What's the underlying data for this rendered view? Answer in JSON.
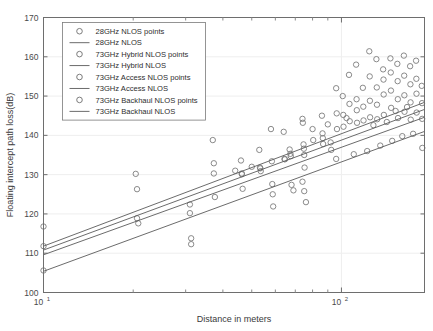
{
  "chart_data": {
    "type": "scatter",
    "title": "",
    "xlabel": "Distance in meters",
    "ylabel": "Floating intercept path loss(dB)",
    "xscale": "log",
    "yscale": "linear",
    "xlim": [
      10,
      190
    ],
    "ylim": [
      100,
      170
    ],
    "yticks": [
      100,
      110,
      120,
      130,
      140,
      150,
      160,
      170
    ],
    "ytick_labels": [
      "100",
      "110",
      "120",
      "130",
      "140",
      "150",
      "160",
      "170"
    ],
    "xtick_majors": [
      {
        "value": 10,
        "mantissa": "10",
        "exponent": "1"
      },
      {
        "value": 100,
        "mantissa": "10",
        "exponent": "2"
      }
    ],
    "xtick_minors": [
      20,
      30,
      40,
      50,
      60,
      70,
      80,
      90,
      200,
      300,
      400,
      500,
      600,
      700,
      800,
      900
    ],
    "grid": true,
    "grid_axis": "y",
    "legend_position": "upper left",
    "marker": "open-circle",
    "marker_color": "#7d7d7d",
    "line_color": "#5a5a5a",
    "legend": [
      {
        "label": "28GHz NLOS points",
        "kind": "marker"
      },
      {
        "label": "28GHz NLOS",
        "kind": "line"
      },
      {
        "label": "73GHz Hybrid NLOS points",
        "kind": "marker"
      },
      {
        "label": "73GHz Hybrid NLOS",
        "kind": "line"
      },
      {
        "label": "73GHz Access NLOS points",
        "kind": "marker"
      },
      {
        "label": "73GHz Access NLOS",
        "kind": "line"
      },
      {
        "label": "73GHz Backhaul NLOS points",
        "kind": "marker"
      },
      {
        "label": "73GHz Backhaul NLOS",
        "kind": "line"
      }
    ],
    "fit_lines": [
      {
        "name": "28GHz NLOS",
        "x_start": 10,
        "y_start": 111.8,
        "x_end": 190,
        "y_end": 148.4
      },
      {
        "name": "73GHz Hybrid NLOS",
        "x_start": 10,
        "y_start": 110.8,
        "x_end": 190,
        "y_end": 146.6
      },
      {
        "name": "73GHz Access NLOS",
        "x_start": 10,
        "y_start": 109.6,
        "x_end": 190,
        "y_end": 144.6
      },
      {
        "name": "73GHz Backhaul NLOS",
        "x_start": 10,
        "y_start": 105.4,
        "x_end": 190,
        "y_end": 141.0
      }
    ],
    "points": [
      [
        10.0,
        116.8
      ],
      [
        10.0,
        111.8
      ],
      [
        10.0,
        105.6
      ],
      [
        20.4,
        130.2
      ],
      [
        20.6,
        126.3
      ],
      [
        20.6,
        118.9
      ],
      [
        20.8,
        117.6
      ],
      [
        31.0,
        122.4
      ],
      [
        31.0,
        120.2
      ],
      [
        31.3,
        113.8
      ],
      [
        31.3,
        112.3
      ],
      [
        37.0,
        138.8
      ],
      [
        37.3,
        132.9
      ],
      [
        37.3,
        130.3
      ],
      [
        37.6,
        124.3
      ],
      [
        46.0,
        133.6
      ],
      [
        46.3,
        130.3
      ],
      [
        46.3,
        130.1
      ],
      [
        46.6,
        126.4
      ],
      [
        53.0,
        136.3
      ],
      [
        53.3,
        131.8
      ],
      [
        53.4,
        131.6
      ],
      [
        53.6,
        130.9
      ],
      [
        58.0,
        141.6
      ],
      [
        58.4,
        133.4
      ],
      [
        58.6,
        127.6
      ],
      [
        58.8,
        125.0
      ],
      [
        59.0,
        121.9
      ],
      [
        64.0,
        140.9
      ],
      [
        64.4,
        134.0
      ],
      [
        64.6,
        133.9
      ],
      [
        67.0,
        136.4
      ],
      [
        67.4,
        135.3
      ],
      [
        67.6,
        134.7
      ],
      [
        74.0,
        144.2
      ],
      [
        74.2,
        143.2
      ],
      [
        74.6,
        137.7
      ],
      [
        74.8,
        136.6
      ],
      [
        75.0,
        135.0
      ],
      [
        75.2,
        131.8
      ],
      [
        80.0,
        141.6
      ],
      [
        80.4,
        138.8
      ],
      [
        86.0,
        145.0
      ],
      [
        86.4,
        140.5
      ],
      [
        86.6,
        139.3
      ],
      [
        86.8,
        137.8
      ],
      [
        92.0,
        138.2
      ],
      [
        92.4,
        136.3
      ],
      [
        96.0,
        152.0
      ],
      [
        96.4,
        145.6
      ],
      [
        96.6,
        141.6
      ],
      [
        101.0,
        150.0
      ],
      [
        101.4,
        145.2
      ],
      [
        101.6,
        142.2
      ],
      [
        106.0,
        155.4
      ],
      [
        106.4,
        148.0
      ],
      [
        106.6,
        143.6
      ],
      [
        112.0,
        158.0
      ],
      [
        112.4,
        149.2
      ],
      [
        112.6,
        146.4
      ],
      [
        112.8,
        143.2
      ],
      [
        118.0,
        152.1
      ],
      [
        118.4,
        147.3
      ],
      [
        118.6,
        143.8
      ],
      [
        124.0,
        161.4
      ],
      [
        124.4,
        155.0
      ],
      [
        124.6,
        148.8
      ],
      [
        124.8,
        144.6
      ],
      [
        131.0,
        159.4
      ],
      [
        131.4,
        152.2
      ],
      [
        131.6,
        147.8
      ],
      [
        131.8,
        144.1
      ],
      [
        138.0,
        156.8
      ],
      [
        138.4,
        154.2
      ],
      [
        138.6,
        150.4
      ],
      [
        138.8,
        145.2
      ],
      [
        146.0,
        159.6
      ],
      [
        146.4,
        156.0
      ],
      [
        146.6,
        151.4
      ],
      [
        146.8,
        147.0
      ],
      [
        154.0,
        158.2
      ],
      [
        154.4,
        153.8
      ],
      [
        154.6,
        149.2
      ],
      [
        154.8,
        144.4
      ],
      [
        162.0,
        160.3
      ],
      [
        162.4,
        155.2
      ],
      [
        162.6,
        150.2
      ],
      [
        162.8,
        146.0
      ],
      [
        170.0,
        157.6
      ],
      [
        170.4,
        153.0
      ],
      [
        170.6,
        148.4
      ],
      [
        170.8,
        144.0
      ],
      [
        178.0,
        159.0
      ],
      [
        178.4,
        154.4
      ],
      [
        178.6,
        150.6
      ],
      [
        178.8,
        145.8
      ],
      [
        186.0,
        152.6
      ],
      [
        186.4,
        148.2
      ],
      [
        186.6,
        144.2
      ],
      [
        186.8,
        136.8
      ],
      [
        74.0,
        128.2
      ],
      [
        75.0,
        125.8
      ],
      [
        76.0,
        123.0
      ],
      [
        68.0,
        127.4
      ],
      [
        69.0,
        126.0
      ],
      [
        96.0,
        134.0
      ],
      [
        110.0,
        135.2
      ],
      [
        122.0,
        136.0
      ],
      [
        135.0,
        137.4
      ],
      [
        148.0,
        138.6
      ],
      [
        160.0,
        139.8
      ],
      [
        174.0,
        140.4
      ],
      [
        44.0,
        131.0
      ],
      [
        50.0,
        132.0
      ],
      [
        128.0,
        142.6
      ],
      [
        142.0,
        143.4
      ],
      [
        152.0,
        146.2
      ],
      [
        166.0,
        147.2
      ],
      [
        90.0,
        142.8
      ],
      [
        104.0,
        144.4
      ]
    ],
    "point_count": 121
  }
}
